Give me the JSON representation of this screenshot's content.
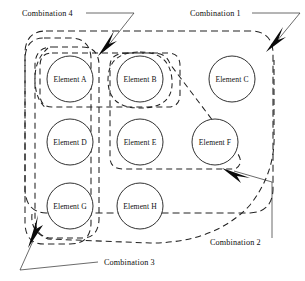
{
  "diagram": {
    "background_color": "#ffffff",
    "stroke_color": "#222222",
    "elements": [
      {
        "id": "A",
        "label": "Element A",
        "cx": 70,
        "cy": 79,
        "r": 23
      },
      {
        "id": "B",
        "label": "Element B",
        "cx": 140,
        "cy": 79,
        "r": 23
      },
      {
        "id": "C",
        "label": "Element C",
        "cx": 232,
        "cy": 79,
        "r": 23
      },
      {
        "id": "D",
        "label": "Element D",
        "cx": 70,
        "cy": 142,
        "r": 23
      },
      {
        "id": "E",
        "label": "Element E",
        "cx": 140,
        "cy": 142,
        "r": 23
      },
      {
        "id": "F",
        "label": "Element F",
        "cx": 215,
        "cy": 142,
        "r": 23
      },
      {
        "id": "G",
        "label": "Element G",
        "cx": 70,
        "cy": 206,
        "r": 23
      },
      {
        "id": "H",
        "label": "Element H",
        "cx": 140,
        "cy": 206,
        "r": 23
      }
    ],
    "combinations": [
      {
        "id": "combination-1",
        "label": "Combination 1",
        "label_x": 190,
        "label_y": 13,
        "members": [
          "A",
          "B",
          "C",
          "D",
          "E",
          "F",
          "G",
          "H"
        ],
        "description": "outer rounded rectangle enclosing all elements"
      },
      {
        "id": "combination-2",
        "label": "Combination 2",
        "label_x": 210,
        "label_y": 242,
        "members": [
          "B",
          "E",
          "F"
        ],
        "description": "wedge region enclosing B, E and F"
      },
      {
        "id": "combination-3",
        "label": "Combination 3",
        "label_x": 104,
        "label_y": 262,
        "members": [
          "A",
          "D",
          "G"
        ],
        "description": "tall rounded region enclosing the left column"
      },
      {
        "id": "combination-4",
        "label": "Combination 4",
        "label_x": 22,
        "label_y": 13,
        "members": [
          "A",
          "B"
        ],
        "description": "region enclosing the top row elements A and B"
      }
    ]
  }
}
